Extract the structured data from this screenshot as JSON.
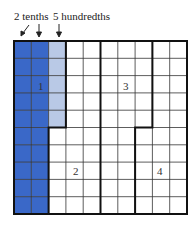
{
  "labels": {
    "tenths": "2 tenths",
    "hundredths": "5 hundredths"
  },
  "grid": {
    "rows": 10,
    "cols": 10,
    "shaded_tenths_columns": 2,
    "shaded_hundredths_cells": 5,
    "colors": {
      "tenths": "#3a68c8",
      "hundredths": "#b9c9e6",
      "line": "#333333",
      "background": "#ffffff"
    }
  },
  "regions": [
    {
      "number": "1"
    },
    {
      "number": "2"
    },
    {
      "number": "3"
    },
    {
      "number": "4"
    }
  ]
}
